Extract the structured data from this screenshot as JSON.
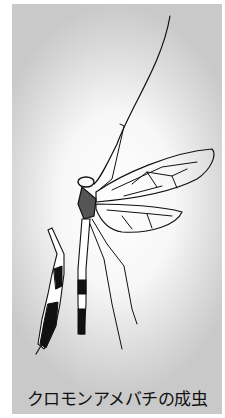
{
  "figure": {
    "caption": "クロモンアメバチの成虫",
    "illustration": "ichneumon-wasp-adult-drawing",
    "colors": {
      "background_center": "#ffffff",
      "background_edge": "#c9c9c9",
      "ink": "#111111"
    }
  }
}
